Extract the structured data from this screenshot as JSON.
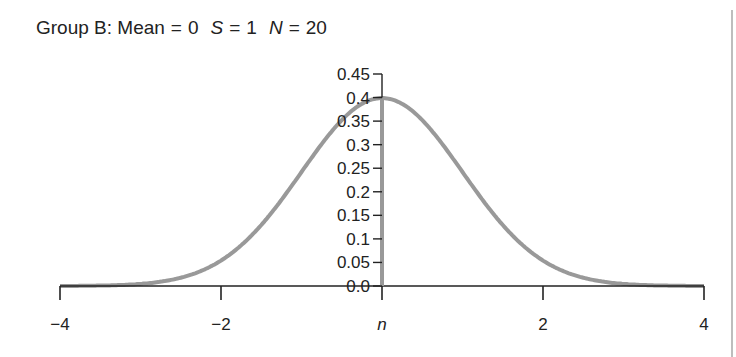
{
  "title": {
    "group": "Group B:",
    "mean_label": "Mean",
    "mean_value": "0",
    "s_label": "S",
    "s_value": "1",
    "n_label": "N",
    "n_value": "20",
    "equals": "="
  },
  "colors": {
    "curve": "#999999",
    "axis": "#222222",
    "text": "#222222"
  },
  "chart_data": {
    "type": "line",
    "xlabel": "",
    "ylabel": "",
    "x_tick_labels": [
      "−4",
      "−2",
      "n",
      "2",
      "4"
    ],
    "x_ticks": [
      -4,
      -2,
      0,
      2,
      4
    ],
    "y_tick_labels": [
      "0.0",
      "0.05",
      "0.1",
      "0.15",
      "0.2",
      "0.25",
      "0.3",
      "0.35",
      "0.4",
      "0.45"
    ],
    "y_ticks": [
      0.0,
      0.05,
      0.1,
      0.15,
      0.2,
      0.25,
      0.3,
      0.35,
      0.4,
      0.45
    ],
    "xlim": [
      -4,
      4
    ],
    "ylim": [
      0,
      0.45
    ],
    "grid": false,
    "legend": null,
    "series": [
      {
        "name": "Normal density (mean 0, SD 1)",
        "x": [
          -4,
          -3.5,
          -3,
          -2.5,
          -2,
          -1.5,
          -1,
          -0.5,
          0,
          0.5,
          1,
          1.5,
          2,
          2.5,
          3,
          3.5,
          4
        ],
        "values": [
          0.0001,
          0.0009,
          0.0044,
          0.0175,
          0.054,
          0.1295,
          0.242,
          0.3521,
          0.3989,
          0.3521,
          0.242,
          0.1295,
          0.054,
          0.0175,
          0.0044,
          0.0009,
          0.0001
        ]
      }
    ],
    "annotations": [
      "y-axis drawn at x = 0 (mean), labelled 'n' on the x-axis"
    ]
  }
}
